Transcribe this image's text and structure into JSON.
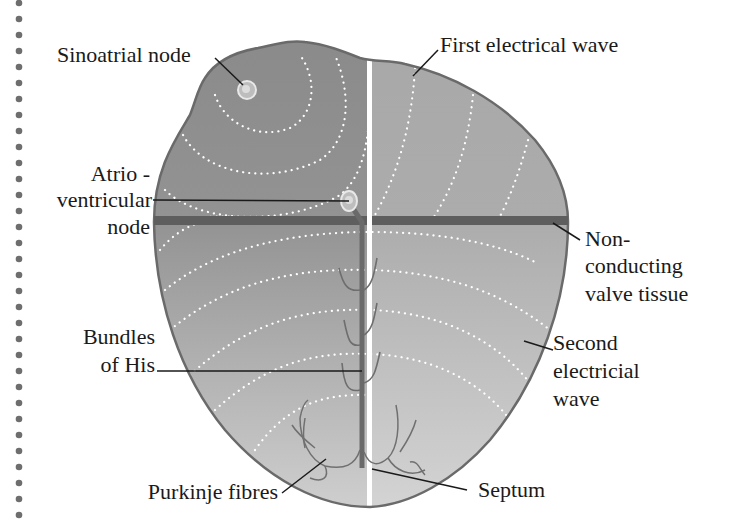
{
  "diagram": {
    "labels": {
      "sinoatrial": "Sinoatrial node",
      "first_wave": "First electrical wave",
      "av_line1": "Atrio -",
      "av_line2": "ventricular",
      "av_line3": "node",
      "nonconducting_line1": "Non-",
      "nonconducting_line2": "conducting",
      "nonconducting_line3": "valve tissue",
      "bundles_line1": "Bundles",
      "bundles_line2": "of His",
      "second_wave_line1": "Second",
      "second_wave_line2": "electricial",
      "second_wave_line3": "wave",
      "purkinje": "Purkinje fibres",
      "septum": "Septum"
    },
    "colors": {
      "atria_left": "#8e8e8e",
      "atria_right": "#a9a9a9",
      "ventricle_left": "#a6a6a6",
      "ventricle_right": "#bdbdbd",
      "outline": "#6a6a6a",
      "valve_band": "#5e5e5e",
      "septum_line": "#ffffff",
      "wave_dots": "#ffffff",
      "leader_lines": "#1a1a1a",
      "binder_dots": "#6e6e6e"
    }
  }
}
